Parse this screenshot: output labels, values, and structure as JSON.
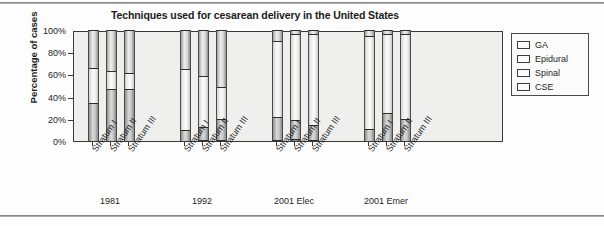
{
  "chart_data": {
    "type": "bar",
    "subtype": "stacked-bar-100-percent",
    "title": "Techniques used for cesarean delivery in the United States",
    "xlabel": "",
    "ylabel": "Percentage of cases",
    "ylim": [
      0,
      100
    ],
    "ytick_labels": [
      "0%",
      "20%",
      "40%",
      "60%",
      "80%",
      "100%"
    ],
    "ytick_values": [
      0,
      20,
      40,
      60,
      80,
      100
    ],
    "grid": false,
    "legend_position": "right",
    "stack_order_bottom_to_top": [
      "CSE",
      "Spinal",
      "Epidural",
      "GA"
    ],
    "series": [
      {
        "name": "GA",
        "values": [
          34,
          37,
          39,
          35,
          41,
          51,
          10,
          4,
          4,
          5,
          4,
          4
        ]
      },
      {
        "name": "Epidural",
        "values": [
          32,
          16,
          14,
          55,
          46,
          29,
          68,
          77,
          82,
          84,
          71,
          76
        ]
      },
      {
        "name": "Spinal",
        "values": [
          34,
          47,
          47,
          10,
          12,
          19,
          21,
          17,
          13,
          11,
          25,
          20
        ]
      },
      {
        "name": "CSE",
        "values": [
          0,
          0,
          0,
          0,
          1,
          1,
          1,
          2,
          1,
          0,
          0,
          0
        ]
      }
    ],
    "categories": [
      "Stratum I",
      "Stratum II",
      "Stratum III",
      "Stratum I",
      "Stratum II",
      "Stratum III",
      "Stratum I",
      "Stratum II",
      "Stratum III",
      "Stratum I",
      "Stratum II",
      "Stratum III"
    ],
    "groups": [
      {
        "label": "1981",
        "categories": [
          "Stratum I",
          "Stratum II",
          "Stratum III"
        ]
      },
      {
        "label": "1992",
        "categories": [
          "Stratum I",
          "Stratum II",
          "Stratum III"
        ]
      },
      {
        "label": "2001 Elec",
        "categories": [
          "Stratum I",
          "Stratum II",
          "Stratum III"
        ]
      },
      {
        "label": "2001 Emer",
        "categories": [
          "Stratum I",
          "Stratum II",
          "Stratum III"
        ]
      }
    ],
    "bars": [
      {
        "group": "1981",
        "category": "Stratum I",
        "CSE": 0,
        "Spinal": 34,
        "Epidural": 32,
        "GA": 34
      },
      {
        "group": "1981",
        "category": "Stratum II",
        "CSE": 0,
        "Spinal": 47,
        "Epidural": 16,
        "GA": 37
      },
      {
        "group": "1981",
        "category": "Stratum III",
        "CSE": 0,
        "Spinal": 47,
        "Epidural": 14,
        "GA": 39
      },
      {
        "group": "1992",
        "category": "Stratum I",
        "CSE": 0,
        "Spinal": 10,
        "Epidural": 55,
        "GA": 35
      },
      {
        "group": "1992",
        "category": "Stratum II",
        "CSE": 1,
        "Spinal": 12,
        "Epidural": 46,
        "GA": 41
      },
      {
        "group": "1992",
        "category": "Stratum III",
        "CSE": 1,
        "Spinal": 19,
        "Epidural": 29,
        "GA": 51
      },
      {
        "group": "2001 Elec",
        "category": "Stratum I",
        "CSE": 1,
        "Spinal": 21,
        "Epidural": 68,
        "GA": 10
      },
      {
        "group": "2001 Elec",
        "category": "Stratum II",
        "CSE": 2,
        "Spinal": 17,
        "Epidural": 77,
        "GA": 4
      },
      {
        "group": "2001 Elec",
        "category": "Stratum III",
        "CSE": 1,
        "Spinal": 13,
        "Epidural": 82,
        "GA": 4
      },
      {
        "group": "2001 Emer",
        "category": "Stratum I",
        "CSE": 0,
        "Spinal": 11,
        "Epidural": 84,
        "GA": 5
      },
      {
        "group": "2001 Emer",
        "category": "Stratum II",
        "CSE": 0,
        "Spinal": 25,
        "Epidural": 71,
        "GA": 4
      },
      {
        "group": "2001 Emer",
        "category": "Stratum III",
        "CSE": 0,
        "Spinal": 20,
        "Epidural": 76,
        "GA": 4
      }
    ]
  },
  "legend": {
    "items": [
      {
        "label": "GA",
        "color": "#cfcfcf"
      },
      {
        "label": "Epidural",
        "color": "#f2f2f2"
      },
      {
        "label": "Spinal",
        "color": "#b9b9b9"
      },
      {
        "label": "CSE",
        "color": "#777777"
      }
    ]
  }
}
